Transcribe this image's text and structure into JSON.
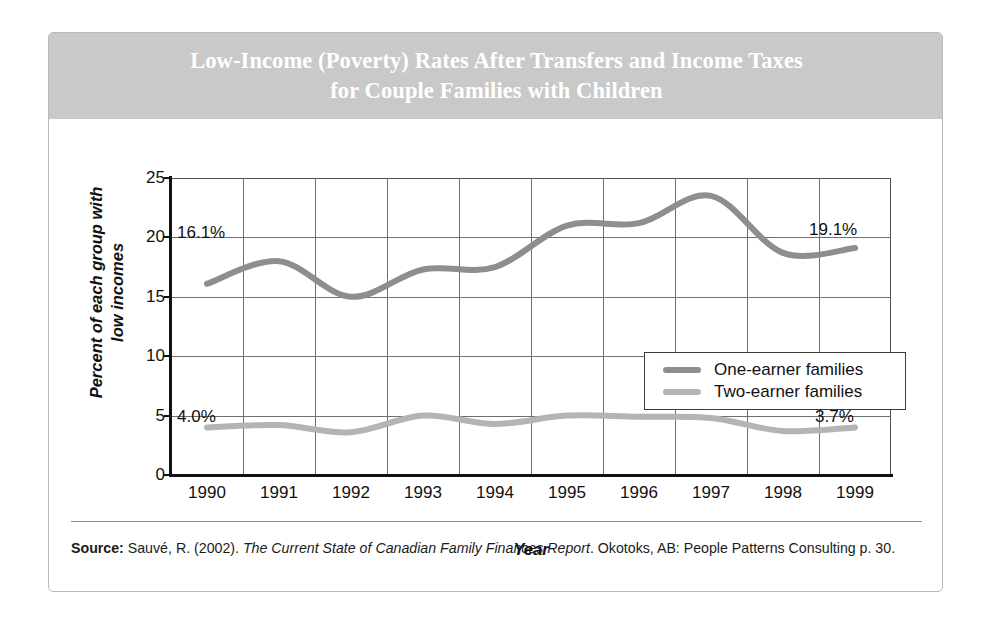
{
  "figure": {
    "title": "Low-Income (Poverty) Rates After Transfers and Income Taxes\nfor Couple Families with Children",
    "title_band_color": "#c9c9c9",
    "card_border_color": "#b9b9b9"
  },
  "source": {
    "label": "Source:",
    "author_year": " Sauvé, R. (2002). ",
    "work_italic": "The Current State of Canadian Family Finances Report",
    "publication": ". Okotoks, AB: People Patterns Consulting p. 30."
  },
  "legend": {
    "items": [
      {
        "label": "One-earner families",
        "color": "#8e8e8e"
      },
      {
        "label": "Two-earner families",
        "color": "#b4b4b4"
      }
    ]
  },
  "annotations": [
    {
      "text": "16.1%",
      "series": "One-earner families",
      "year": 1990
    },
    {
      "text": "19.1%",
      "series": "One-earner families",
      "year": 1999
    },
    {
      "text": "4.0%",
      "series": "Two-earner families",
      "year": 1990
    },
    {
      "text": "3.7%",
      "series": "Two-earner families",
      "year": 1999
    }
  ],
  "chart_data": {
    "type": "line",
    "title": "Low-Income (Poverty) Rates After Transfers and Income Taxes for Couple Families with Children",
    "xlabel": "Year",
    "ylabel": "Percent of each group with low incomes",
    "categories": [
      "1990",
      "1991",
      "1992",
      "1993",
      "1994",
      "1995",
      "1996",
      "1997",
      "1998",
      "1999"
    ],
    "x": [
      1990,
      1991,
      1992,
      1993,
      1994,
      1995,
      1996,
      1997,
      1998,
      1999
    ],
    "series": [
      {
        "name": "One-earner families",
        "color": "#8e8e8e",
        "values": [
          16.1,
          18.0,
          15.0,
          17.3,
          17.5,
          21.0,
          21.2,
          23.5,
          18.7,
          19.1
        ]
      },
      {
        "name": "Two-earner families",
        "color": "#b4b4b4",
        "values": [
          4.0,
          4.2,
          3.6,
          5.0,
          4.3,
          5.0,
          4.9,
          4.8,
          3.7,
          4.0
        ]
      }
    ],
    "ylim": [
      0,
      25
    ],
    "yticks": [
      0,
      5,
      10,
      15,
      20,
      25
    ],
    "ytick_labels": [
      "0",
      "5",
      "10",
      "15",
      "20",
      "25"
    ],
    "xlim": [
      1989.5,
      1999.5
    ],
    "grid": true,
    "legend_position": "center-right",
    "units": "percent"
  }
}
